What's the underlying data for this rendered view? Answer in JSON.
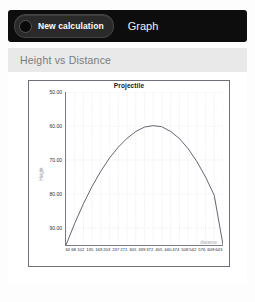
{
  "toolbar": {
    "new_calculation_label": "New calculation",
    "graph_label": "Graph",
    "dot_icon": "radio-dot-icon"
  },
  "subheader": {
    "title": "Height vs Distance"
  },
  "chart_data": {
    "type": "line",
    "title": "Projectile",
    "xlabel": "distance",
    "ylabel": "Height",
    "grid": true,
    "legend": false,
    "y_inverted": true,
    "ylim": [
      50.0,
      95.0
    ],
    "yticks": [
      "50.00",
      "60.00",
      "70.00",
      "80.00",
      "90.00"
    ],
    "ytick_values": [
      50.0,
      60.0,
      70.0,
      80.0,
      90.0
    ],
    "xlim": [
      34,
      643
    ],
    "xticks": [
      "34",
      "68",
      "102",
      "135",
      "169",
      "203",
      "237",
      "271",
      "305",
      "339",
      "372",
      "405",
      "440",
      "474",
      "508",
      "542",
      "576",
      "609",
      "643"
    ],
    "series": [
      {
        "name": "Projectile",
        "color": "#555560",
        "x": [
          34,
          68,
          102,
          135,
          169,
          203,
          237,
          271,
          305,
          339,
          372,
          405,
          440,
          474,
          508,
          542,
          576,
          609,
          643
        ],
        "y": [
          95.0,
          88.6,
          82.8,
          77.8,
          73.3,
          69.4,
          66.2,
          63.6,
          61.6,
          60.3,
          59.9,
          60.2,
          61.6,
          63.7,
          66.7,
          70.5,
          75.1,
          80.4,
          95.0
        ]
      }
    ]
  }
}
